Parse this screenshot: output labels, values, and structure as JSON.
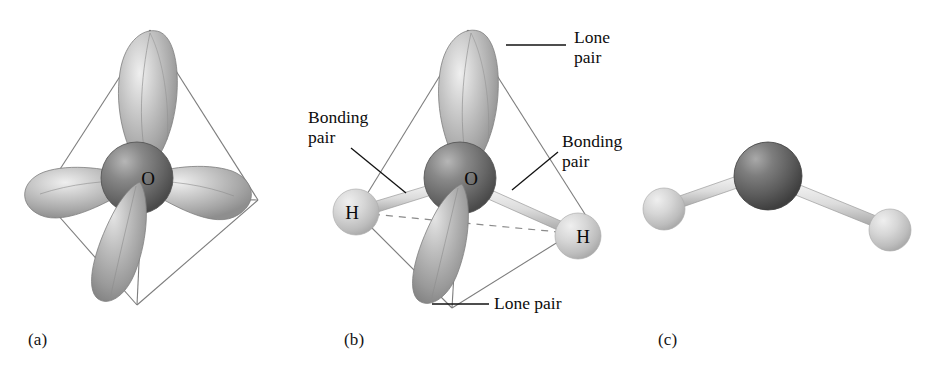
{
  "figure": {
    "background_color": "#ffffff",
    "title_text": ""
  },
  "panels": [
    {
      "id": "a",
      "caption": "(a)",
      "caption_x": 28,
      "caption_y": 330,
      "center_atom_label": "O",
      "center_atom_x": 137,
      "center_atom_y": 178,
      "center_atom_r": 36,
      "center_atom_color": "#6e6e6e",
      "lobe_count": 4,
      "lobe_color": "#b4b4b4",
      "wireframe_color": "#7a7a7a",
      "dashed_line_color": "#8a8a8a"
    },
    {
      "id": "b",
      "caption": "(b)",
      "caption_x": 344,
      "caption_y": 330,
      "center_atom_label": "O",
      "center_atom_x": 460,
      "center_atom_y": 178,
      "center_atom_r": 36,
      "center_atom_color": "#6e6e6e",
      "hydrogen_label_left": "H",
      "hydrogen_left_x": 356,
      "hydrogen_left_y": 212,
      "hydrogen_label_right": "H",
      "hydrogen_right_x": 578,
      "hydrogen_right_y": 236,
      "hydrogen_r": 23,
      "hydrogen_color": "#c9c9c9",
      "bond_color": "#d2d2d2",
      "lobe_color": "#b4b4b4",
      "wireframe_color": "#7a7a7a",
      "dashed_line_color": "#8a8a8a"
    },
    {
      "id": "c",
      "caption": "(c)",
      "caption_x": 658,
      "caption_y": 330,
      "center_atom_label": "",
      "center_atom_x": 768,
      "center_atom_y": 176,
      "center_atom_r": 34,
      "center_atom_color": "#5f5f5f",
      "hydrogen_left_x": 664,
      "hydrogen_left_y": 209,
      "hydrogen_right_x": 890,
      "hydrogen_right_y": 230,
      "hydrogen_r": 21,
      "hydrogen_color": "#c9c9c9",
      "bond_color": "#d2d2d2"
    }
  ],
  "callouts": [
    {
      "name": "lone-pair-top",
      "text": "Lone\npair",
      "x": 574,
      "y": 28,
      "leader_from_x": 566,
      "leader_from_y": 45,
      "leader_to_x": 505,
      "leader_to_y": 45
    },
    {
      "name": "bonding-pair-left",
      "text": "Bonding\npair",
      "x": 308,
      "y": 108,
      "leader_from_x": 351,
      "leader_from_y": 148,
      "leader_to_x": 404,
      "leader_to_y": 192
    },
    {
      "name": "bonding-pair-right",
      "text": "Bonding\npair",
      "x": 562,
      "y": 132,
      "leader_from_x": 558,
      "leader_from_y": 152,
      "leader_to_x": 512,
      "leader_to_y": 190
    },
    {
      "name": "lone-pair-bottom",
      "text": "Lone pair",
      "x": 494,
      "y": 294,
      "leader_from_x": 488,
      "leader_from_y": 304,
      "leader_to_x": 433,
      "leader_to_y": 304
    }
  ],
  "colors": {
    "oxygen_sphere": "#6e6e6e",
    "hydrogen_sphere": "#c9c9c9",
    "orbital_lobe": "#b4b4b4",
    "wireframe": "#7a7a7a",
    "bond_rod": "#d2d2d2",
    "text": "#0d0d0d",
    "background": "#ffffff"
  }
}
